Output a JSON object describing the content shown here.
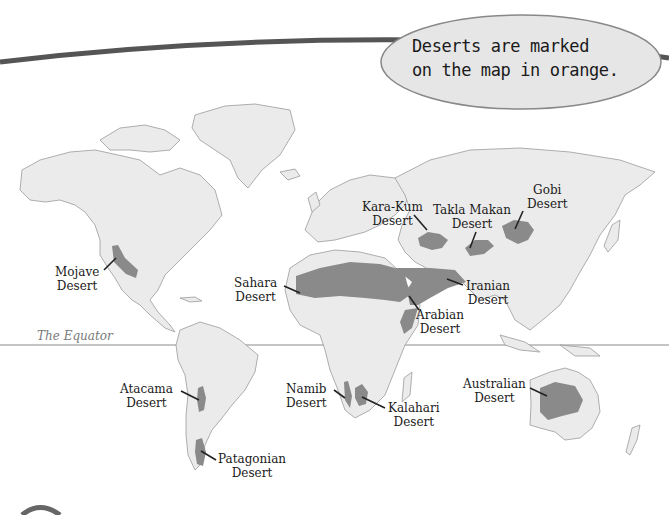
{
  "callout": {
    "line1": "Deserts are marked",
    "line2": "on the map in orange."
  },
  "equator": {
    "label": "The Equator"
  },
  "colors": {
    "land": "#ebebeb",
    "coast": "#9a9a9a",
    "desert": "#8a8a8a",
    "banner": "#555555",
    "bubble_fill": "#e6e6e6"
  },
  "deserts": [
    {
      "id": "mojave",
      "line1": "Mojave",
      "line2": "Desert"
    },
    {
      "id": "sahara",
      "line1": "Sahara",
      "line2": "Desert"
    },
    {
      "id": "kara-kum",
      "line1": "Kara-Kum",
      "line2": "Desert"
    },
    {
      "id": "takla-makan",
      "line1": "Takla Makan",
      "line2": "Desert"
    },
    {
      "id": "gobi",
      "line1": "Gobi",
      "line2": "Desert"
    },
    {
      "id": "iranian",
      "line1": "Iranian",
      "line2": "Desert"
    },
    {
      "id": "arabian",
      "line1": "Arabian",
      "line2": "Desert"
    },
    {
      "id": "atacama",
      "line1": "Atacama",
      "line2": "Desert"
    },
    {
      "id": "patagonian",
      "line1": "Patagonian",
      "line2": "Desert"
    },
    {
      "id": "namib",
      "line1": "Namib",
      "line2": "Desert"
    },
    {
      "id": "kalahari",
      "line1": "Kalahari",
      "line2": "Desert"
    },
    {
      "id": "australian",
      "line1": "Australian",
      "line2": "Desert"
    }
  ]
}
